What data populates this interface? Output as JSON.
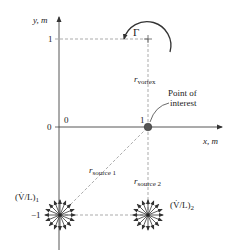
{
  "axes": {
    "x_label": "x, m",
    "y_label": "y, m",
    "origin_x_tick": "0",
    "origin_y_tick": "0",
    "x_tick_1": "1",
    "y_tick_1": "1",
    "y_tick_neg1": "−1"
  },
  "vortex": {
    "symbol": "Γ",
    "distance_label_main": "r",
    "distance_label_sub": "vortex"
  },
  "point_of_interest": {
    "label_line1": "Point of",
    "label_line2": "interest"
  },
  "source1": {
    "label_main": "(V̇/L)",
    "label_sub": "1",
    "distance_label_main": "r",
    "distance_label_sub": "source 1"
  },
  "source2": {
    "label_main": "(V̇/L)",
    "label_sub": "2",
    "distance_label_main": "r",
    "distance_label_sub": "source 2"
  },
  "colors": {
    "axis": "#444444",
    "dashed": "#888888",
    "point": "#555555",
    "text": "#222222"
  }
}
